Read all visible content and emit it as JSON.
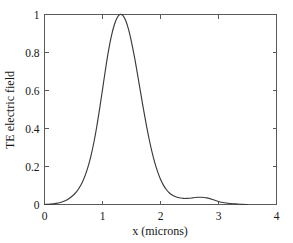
{
  "chart_data": {
    "type": "line",
    "title": "",
    "xlabel": "x (microns)",
    "ylabel": "TE electric field",
    "xlim": [
      0,
      4
    ],
    "ylim": [
      0,
      1
    ],
    "xticks": [
      0,
      1,
      2,
      3,
      4
    ],
    "xticklabels": [
      "0",
      "1",
      "2",
      "3",
      "4"
    ],
    "yticks": [
      0,
      0.2,
      0.4,
      0.6,
      0.8,
      1
    ],
    "yticklabels": [
      "0",
      "0.2",
      "0.4",
      "0.6",
      "0.8",
      "1"
    ],
    "grid": false,
    "legend": null,
    "box": true,
    "line_color": "#3a3a3a",
    "background_color": "#ffffff",
    "axis_color": "#5a5a5a",
    "series": [
      {
        "name": "TE electric field",
        "x": [
          0.0,
          0.1,
          0.2,
          0.3,
          0.4,
          0.5,
          0.55,
          0.6,
          0.65,
          0.7,
          0.75,
          0.8,
          0.85,
          0.9,
          0.95,
          1.0,
          1.05,
          1.1,
          1.15,
          1.2,
          1.25,
          1.3,
          1.35,
          1.4,
          1.45,
          1.5,
          1.55,
          1.6,
          1.65,
          1.7,
          1.75,
          1.8,
          1.85,
          1.9,
          1.95,
          2.0,
          2.05,
          2.1,
          2.15,
          2.2,
          2.25,
          2.3,
          2.35,
          2.4,
          2.45,
          2.5,
          2.55,
          2.6,
          2.65,
          2.7,
          2.75,
          2.8,
          2.85,
          2.9,
          2.95,
          3.0,
          3.05,
          3.1,
          3.15,
          3.2,
          3.3,
          3.4,
          3.5
        ],
        "y": [
          0.0,
          0.002,
          0.006,
          0.013,
          0.026,
          0.05,
          0.066,
          0.088,
          0.116,
          0.152,
          0.198,
          0.255,
          0.325,
          0.408,
          0.503,
          0.605,
          0.708,
          0.803,
          0.882,
          0.942,
          0.982,
          1.0,
          0.995,
          0.968,
          0.92,
          0.855,
          0.778,
          0.692,
          0.602,
          0.513,
          0.428,
          0.35,
          0.281,
          0.222,
          0.173,
          0.133,
          0.102,
          0.079,
          0.062,
          0.05,
          0.042,
          0.037,
          0.034,
          0.032,
          0.032,
          0.033,
          0.035,
          0.037,
          0.038,
          0.038,
          0.037,
          0.035,
          0.031,
          0.026,
          0.021,
          0.016,
          0.012,
          0.009,
          0.007,
          0.005,
          0.003,
          0.001,
          0.0
        ]
      }
    ]
  },
  "axes": {
    "xlabel": "x (microns)",
    "ylabel": "TE electric field"
  }
}
